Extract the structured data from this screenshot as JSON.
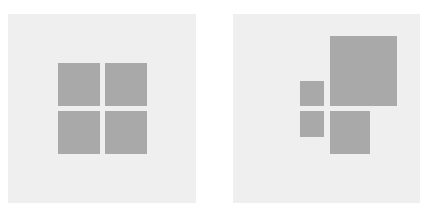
{
  "colors": {
    "page_background": "#ffffff",
    "panel_background": "#efefef",
    "square_fill": "#a9a9a9"
  },
  "panels": [
    {
      "name": "equal-grid",
      "box": [
        8,
        14,
        188,
        189
      ],
      "squares": [
        {
          "name": "top-left",
          "box": [
            58,
            63,
            42,
            43
          ]
        },
        {
          "name": "top-right",
          "box": [
            105,
            63,
            42,
            43
          ]
        },
        {
          "name": "bottom-left",
          "box": [
            58,
            111,
            42,
            43
          ]
        },
        {
          "name": "bottom-right",
          "box": [
            105,
            111,
            42,
            43
          ]
        }
      ]
    },
    {
      "name": "scaled-grid",
      "box": [
        233,
        14,
        187,
        189
      ],
      "squares": [
        {
          "name": "top-left-small",
          "box": [
            300,
            81,
            24,
            25
          ]
        },
        {
          "name": "top-right-large",
          "box": [
            330,
            36,
            67,
            70
          ]
        },
        {
          "name": "bottom-left-small",
          "box": [
            300,
            111,
            24,
            26
          ]
        },
        {
          "name": "bottom-right-medium",
          "box": [
            330,
            111,
            40,
            43
          ]
        }
      ]
    }
  ]
}
